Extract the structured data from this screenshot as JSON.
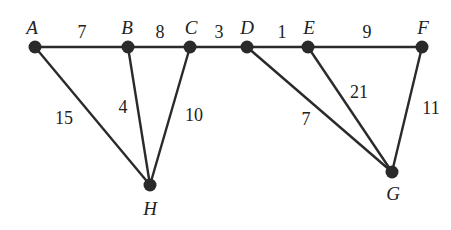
{
  "diagram": {
    "type": "weighted-graph",
    "nodes": [
      {
        "id": "A",
        "label": "A",
        "x": 35,
        "y": 47,
        "lx": 32,
        "ly": 34
      },
      {
        "id": "B",
        "label": "B",
        "x": 128,
        "y": 47,
        "lx": 127,
        "ly": 34
      },
      {
        "id": "C",
        "label": "C",
        "x": 190,
        "y": 47,
        "lx": 191,
        "ly": 34
      },
      {
        "id": "D",
        "label": "D",
        "x": 247,
        "y": 47,
        "lx": 247,
        "ly": 34
      },
      {
        "id": "E",
        "label": "E",
        "x": 308,
        "y": 47,
        "lx": 309,
        "ly": 34
      },
      {
        "id": "F",
        "label": "F",
        "x": 422,
        "y": 47,
        "lx": 423,
        "ly": 34
      },
      {
        "id": "H",
        "label": "H",
        "x": 150,
        "y": 185,
        "lx": 150,
        "ly": 215
      },
      {
        "id": "G",
        "label": "G",
        "x": 392,
        "y": 172,
        "lx": 393,
        "ly": 200
      }
    ],
    "edges": [
      {
        "from": "A",
        "to": "B",
        "weight": "7",
        "lx": 82,
        "ly": 38
      },
      {
        "from": "B",
        "to": "C",
        "weight": "8",
        "lx": 160,
        "ly": 38
      },
      {
        "from": "C",
        "to": "D",
        "weight": "3",
        "lx": 219,
        "ly": 38
      },
      {
        "from": "D",
        "to": "E",
        "weight": "1",
        "lx": 282,
        "ly": 38
      },
      {
        "from": "E",
        "to": "F",
        "weight": "9",
        "lx": 367,
        "ly": 38
      },
      {
        "from": "A",
        "to": "H",
        "weight": "15",
        "lx": 64,
        "ly": 124
      },
      {
        "from": "B",
        "to": "H",
        "weight": "4",
        "lx": 123,
        "ly": 113
      },
      {
        "from": "C",
        "to": "H",
        "weight": "10",
        "lx": 194,
        "ly": 121
      },
      {
        "from": "D",
        "to": "G",
        "weight": "7",
        "lx": 306,
        "ly": 125
      },
      {
        "from": "E",
        "to": "G",
        "weight": "21",
        "lx": 359,
        "ly": 98
      },
      {
        "from": "F",
        "to": "G",
        "weight": "11",
        "lx": 431,
        "ly": 114
      }
    ]
  }
}
